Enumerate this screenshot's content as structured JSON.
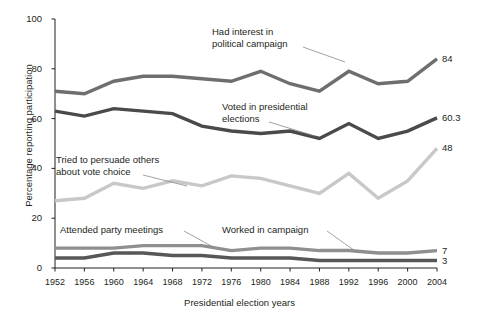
{
  "title_cutoff": "Trends in political participation",
  "axes": {
    "ylabel": "Percentage reporting participation",
    "xlabel": "Presidential election years",
    "yticks": [
      "0",
      "20",
      "40",
      "60",
      "80",
      "100"
    ],
    "xticks": [
      "1952",
      "1956",
      "1960",
      "1964",
      "1968",
      "1972",
      "1976",
      "1980",
      "1984",
      "1988",
      "1992",
      "1996",
      "2000",
      "2004"
    ]
  },
  "annotations": [
    {
      "name": "had-interest",
      "line1": "Had interest in",
      "line2": "political campaign"
    },
    {
      "name": "voted",
      "line1": "Voted in presidential",
      "line2": "elections"
    },
    {
      "name": "persuade",
      "line1": "Tried to persuade others",
      "line2": "about vote choice"
    },
    {
      "name": "attended",
      "line1": "Attended party meetings",
      "line2": ""
    },
    {
      "name": "worked",
      "line1": "Worked in campaign",
      "line2": ""
    }
  ],
  "end_labels": {
    "had_interest": "84",
    "voted": "60.3",
    "persuade": "48",
    "attended": "7",
    "worked": "3"
  },
  "colors": {
    "interest": "#6e6e6e",
    "voted": "#4a4a4a",
    "persuade": "#c8c8c8",
    "attended": "#8f8f8f",
    "worked": "#575757",
    "axis": "#231f20"
  },
  "chart_data": {
    "type": "line",
    "title": "Trends in political participation",
    "xlabel": "Presidential election years",
    "ylabel": "Percentage reporting participation",
    "ylim": [
      0,
      100
    ],
    "grid": false,
    "legend": "inline-annotations",
    "categories": [
      "1952",
      "1956",
      "1960",
      "1964",
      "1968",
      "1972",
      "1976",
      "1980",
      "1984",
      "1988",
      "1992",
      "1996",
      "2000",
      "2004"
    ],
    "series": [
      {
        "name": "Had interest in political campaign",
        "color": "#6e6e6e",
        "end_label": "84",
        "values": [
          71,
          70,
          75,
          77,
          77,
          76,
          75,
          79,
          74,
          71,
          79,
          74,
          75,
          84
        ]
      },
      {
        "name": "Voted in presidential elections",
        "color": "#4a4a4a",
        "end_label": "60.3",
        "values": [
          63,
          61,
          64,
          63,
          62,
          57,
          55,
          54,
          55,
          52,
          58,
          52,
          55,
          60.3
        ]
      },
      {
        "name": "Tried to persuade others about vote choice",
        "color": "#c8c8c8",
        "end_label": "48",
        "values": [
          27,
          28,
          34,
          32,
          35,
          33,
          37,
          36,
          33,
          30,
          38,
          28,
          35,
          48
        ]
      },
      {
        "name": "Attended party meetings",
        "color": "#8f8f8f",
        "end_label": "7",
        "values": [
          8,
          8,
          8,
          9,
          9,
          9,
          7,
          8,
          8,
          7,
          7,
          6,
          6,
          7
        ]
      },
      {
        "name": "Worked in campaign",
        "color": "#575757",
        "end_label": "3",
        "values": [
          4,
          4,
          6,
          6,
          5,
          5,
          4,
          4,
          4,
          3,
          3,
          3,
          3,
          3
        ]
      }
    ]
  }
}
